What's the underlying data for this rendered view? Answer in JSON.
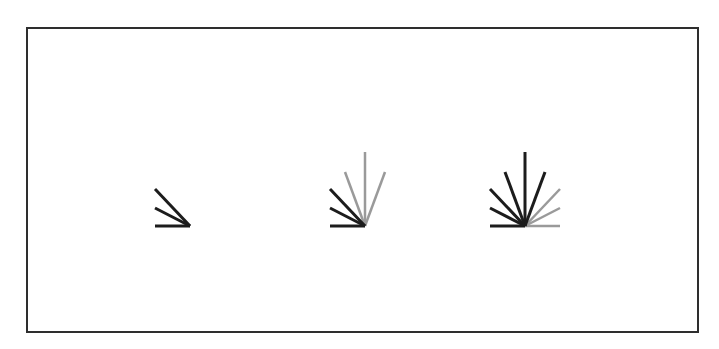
{
  "figure": {
    "frame": {
      "x": 27,
      "y": 28,
      "width": 671,
      "height": 304,
      "stroke": "#2e2e2e",
      "stroke_width": 2
    },
    "colors": {
      "dark": "#1c1c1c",
      "light": "#9a9a9a"
    },
    "ray_offsets": [
      [
        -35,
        0
      ],
      [
        -35,
        -18
      ],
      [
        -35,
        -37
      ],
      [
        -20,
        -54
      ],
      [
        0,
        -74
      ],
      [
        20,
        -54
      ],
      [
        35,
        -37
      ],
      [
        35,
        -18
      ],
      [
        35,
        0
      ]
    ],
    "fans": [
      {
        "name": "fan-1",
        "origin": [
          190,
          226
        ],
        "rays": [
          {
            "i": 0,
            "tone": "dark"
          },
          {
            "i": 1,
            "tone": "dark"
          },
          {
            "i": 2,
            "tone": "dark"
          }
        ]
      },
      {
        "name": "fan-2",
        "origin": [
          365,
          226
        ],
        "rays": [
          {
            "i": 0,
            "tone": "dark"
          },
          {
            "i": 1,
            "tone": "dark"
          },
          {
            "i": 2,
            "tone": "dark"
          },
          {
            "i": 3,
            "tone": "light"
          },
          {
            "i": 4,
            "tone": "light"
          },
          {
            "i": 5,
            "tone": "light"
          }
        ]
      },
      {
        "name": "fan-3",
        "origin": [
          525,
          226
        ],
        "rays": [
          {
            "i": 0,
            "tone": "dark"
          },
          {
            "i": 1,
            "tone": "dark"
          },
          {
            "i": 2,
            "tone": "dark"
          },
          {
            "i": 3,
            "tone": "dark"
          },
          {
            "i": 4,
            "tone": "dark"
          },
          {
            "i": 5,
            "tone": "dark"
          },
          {
            "i": 6,
            "tone": "light"
          },
          {
            "i": 7,
            "tone": "light"
          },
          {
            "i": 8,
            "tone": "light"
          }
        ]
      }
    ]
  }
}
